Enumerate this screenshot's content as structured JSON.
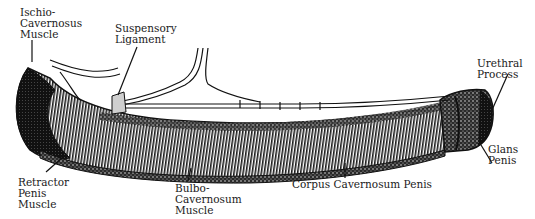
{
  "diagram": {
    "labels": [
      {
        "id": "ischio-cavernosus-muscle",
        "lines": [
          "Ischio-",
          "Cavernosus",
          "Muscle"
        ]
      },
      {
        "id": "suspensory-ligament",
        "lines": [
          "Suspensory",
          "Ligament"
        ]
      },
      {
        "id": "urethral-process",
        "lines": [
          "Urethral",
          "Process"
        ]
      },
      {
        "id": "glans-penis",
        "lines": [
          "Glans",
          "Penis"
        ]
      },
      {
        "id": "retractor-penis-muscle",
        "lines": [
          "Retractor",
          "Penis",
          "Muscle"
        ]
      },
      {
        "id": "bulbo-cavernosum-muscle",
        "lines": [
          "Bulbo-",
          "Cavernosum",
          "Muscle"
        ]
      },
      {
        "id": "corpus-cavernosum-penis",
        "lines": [
          "Corpus Cavernosum Penis"
        ]
      }
    ],
    "colors": {
      "ink": "#111111",
      "paper": "#ffffff",
      "shade": "#3a3a3a",
      "light": "#8a8a8a"
    }
  }
}
